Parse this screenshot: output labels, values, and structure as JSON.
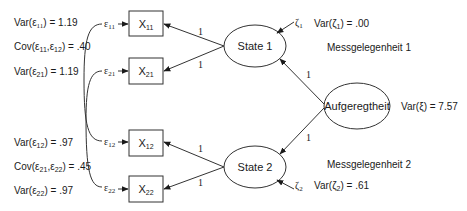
{
  "diagram": {
    "type": "structural-equation-model",
    "left_params": {
      "var_e11": {
        "label": "Var(ε",
        "sub": "11",
        "suffix": ") = 1.19"
      },
      "cov_e11_e12": {
        "label": "Cov(ε",
        "sub1": "11",
        "mid": ",ε",
        "sub2": "12",
        "suffix": ") = .40"
      },
      "var_e21": {
        "label": "Var(ε",
        "sub": "21",
        "suffix": ") = 1.19"
      },
      "var_e12": {
        "label": "Var(ε",
        "sub": "12",
        "suffix": ") = .97"
      },
      "cov_e21_e22": {
        "label": "Cov(ε",
        "sub1": "21",
        "mid": ",ε",
        "sub2": "22",
        "suffix": ") = .45"
      },
      "var_e22": {
        "label": "Var(ε",
        "sub": "22",
        "suffix": ") = .97"
      }
    },
    "errors": [
      {
        "id": "e11",
        "symbol": "ε",
        "sub": "11"
      },
      {
        "id": "e21",
        "symbol": "ε",
        "sub": "21"
      },
      {
        "id": "e12",
        "symbol": "ε",
        "sub": "12"
      },
      {
        "id": "e22",
        "symbol": "ε",
        "sub": "22"
      }
    ],
    "indicators": [
      {
        "id": "X11",
        "label": "X",
        "sub": "11"
      },
      {
        "id": "X21",
        "label": "X",
        "sub": "21"
      },
      {
        "id": "X12",
        "label": "X",
        "sub": "12"
      },
      {
        "id": "X22",
        "label": "X",
        "sub": "22"
      }
    ],
    "latents": {
      "state1": {
        "label": "State 1"
      },
      "state2": {
        "label": "State 2"
      },
      "trait": {
        "label": "Aufgeregtheit"
      }
    },
    "loadings": {
      "state1_x11": "1",
      "state1_x21": "1",
      "state2_x12": "1",
      "state2_x22": "1",
      "trait_state1": "1",
      "trait_state2": "1"
    },
    "disturbances": {
      "zeta1": {
        "symbol": "ζ",
        "sub": "1",
        "var_label": "Var(ζ",
        "var_sub": "1",
        "var_suffix": ") = .00"
      },
      "zeta2": {
        "symbol": "ζ",
        "sub": "2",
        "var_label": "Var(ζ",
        "var_sub": "2",
        "var_suffix": ") = .61"
      }
    },
    "trait_variance": {
      "label": "Var(ξ) = 7.57"
    },
    "occasions": {
      "occasion1": "Messgelegenheit 1",
      "occasion2": "Messgelegenheit 2"
    }
  }
}
